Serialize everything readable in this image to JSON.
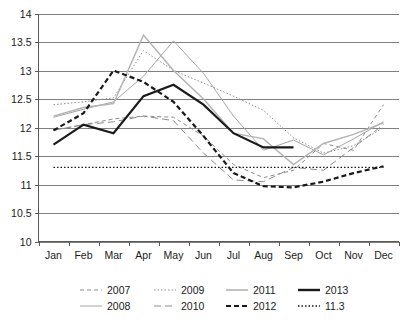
{
  "chart_data": {
    "type": "line",
    "title": "",
    "xlabel": "",
    "ylabel": "",
    "categories": [
      "Jan",
      "Feb",
      "Mar",
      "Apr",
      "May",
      "Jun",
      "Jul",
      "Aug",
      "Sep",
      "Oct",
      "Nov",
      "Dec"
    ],
    "ylim": [
      10,
      14
    ],
    "ytick_step": 0.5,
    "ytick_labels": [
      "10",
      "10.5",
      "11",
      "11.5",
      "12",
      "12.5",
      "13",
      "13.5",
      "14"
    ],
    "grid": true,
    "legend_position": "bottom",
    "series": [
      {
        "name": "2007",
        "style": "dashed",
        "color": "#8c8c8c",
        "width": 1,
        "dash": "4,3",
        "values": [
          11.95,
          12.05,
          12.15,
          12.2,
          12.18,
          11.85,
          11.35,
          11.12,
          11.25,
          11.72,
          11.6,
          12.4
        ]
      },
      {
        "name": "2008",
        "style": "solid",
        "color": "#a6a6a6",
        "width": 1,
        "dash": "",
        "values": [
          12.18,
          12.32,
          12.45,
          12.9,
          13.52,
          12.95,
          12.2,
          11.6,
          11.78,
          11.52,
          11.8,
          12.1
        ]
      },
      {
        "name": "2009",
        "style": "dotted",
        "color": "#8c8c8c",
        "width": 1,
        "dash": "1.5,2",
        "values": [
          12.4,
          12.45,
          12.52,
          13.35,
          13.0,
          12.78,
          12.55,
          12.3,
          11.82,
          11.55,
          11.68,
          12.0
        ]
      },
      {
        "name": "2010",
        "style": "long-dash",
        "color": "#8c8c8c",
        "width": 1,
        "dash": "7,4",
        "values": [
          11.95,
          12.05,
          12.1,
          12.2,
          12.12,
          11.55,
          11.08,
          11.05,
          11.3,
          11.25,
          11.65,
          12.05
        ]
      },
      {
        "name": "2011",
        "style": "solid",
        "color": "#b3b3b3",
        "width": 1.4,
        "dash": "",
        "values": [
          12.2,
          12.35,
          12.42,
          13.62,
          13.0,
          12.5,
          11.9,
          11.8,
          11.35,
          11.72,
          11.88,
          12.08
        ]
      },
      {
        "name": "2012",
        "style": "thick-dashed",
        "color": "#1a1a1a",
        "width": 2.2,
        "dash": "5,3",
        "values": [
          11.95,
          12.25,
          13.0,
          12.8,
          12.45,
          11.85,
          11.2,
          10.97,
          10.95,
          11.05,
          11.2,
          11.32
        ]
      },
      {
        "name": "2013",
        "style": "thick-solid",
        "color": "#1a1a1a",
        "width": 2.2,
        "dash": "",
        "values": [
          11.7,
          12.05,
          11.9,
          12.55,
          12.75,
          12.4,
          11.9,
          11.65,
          11.65,
          null,
          null,
          null
        ]
      },
      {
        "name": "11.3",
        "style": "dotted-reference",
        "color": "#1a1a1a",
        "width": 1.4,
        "dash": "1.5,2",
        "values": [
          11.3,
          11.3,
          11.3,
          11.3,
          11.3,
          11.3,
          11.3,
          11.3,
          11.3,
          11.3,
          11.3,
          11.3
        ]
      }
    ],
    "legend": [
      {
        "label": "2007",
        "color": "#8c8c8c",
        "dash": "4,3",
        "width": 1
      },
      {
        "label": "2009",
        "color": "#8c8c8c",
        "dash": "1.5,2",
        "width": 1
      },
      {
        "label": "2011",
        "color": "#b3b3b3",
        "dash": "",
        "width": 1.6
      },
      {
        "label": "2013",
        "color": "#1a1a1a",
        "dash": "",
        "width": 2.4
      },
      {
        "label": "2008",
        "color": "#a6a6a6",
        "dash": "",
        "width": 1
      },
      {
        "label": "2010",
        "color": "#8c8c8c",
        "dash": "7,4",
        "width": 1
      },
      {
        "label": "2012",
        "color": "#1a1a1a",
        "dash": "5,3",
        "width": 2.2
      },
      {
        "label": "11.3",
        "color": "#1a1a1a",
        "dash": "1.5,2",
        "width": 1.4
      }
    ]
  }
}
